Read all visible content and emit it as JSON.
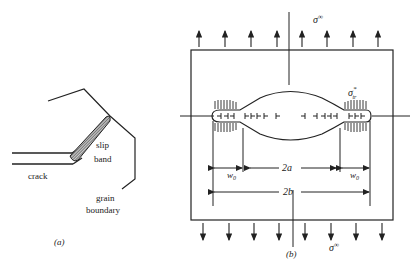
{
  "panel_a": {
    "caption": "(a)",
    "labels": {
      "crack": "crack",
      "slip": "slip",
      "band": "band",
      "grain": "grain",
      "boundary": "boundary"
    }
  },
  "panel_b": {
    "caption": "(b)",
    "labels": {
      "sigma_top": "σ",
      "sigma_top_sup": "∞",
      "sigma_bottom": "σ",
      "sigma_bottom_sup": "∞",
      "sigma_tr": "σ",
      "sigma_tr_sup": "*",
      "sigma_tr_sub": "tr",
      "w0_left": "w",
      "w0_left_sub": "0",
      "w0_right": "w",
      "w0_right_sub": "0",
      "two_a": "2a",
      "two_b": "2b"
    },
    "arrows_top_count": 8,
    "arrows_bottom_count": 8
  },
  "colors": {
    "ink": "#222222",
    "background": "#ffffff"
  }
}
